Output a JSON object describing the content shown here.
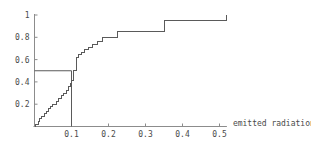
{
  "chart_data": {
    "type": "line",
    "subtype": "step-cdf",
    "title": "",
    "subtitle": "",
    "xlabel": "emitted radiation",
    "ylabel": "",
    "xlim": [
      0.0,
      0.52
    ],
    "ylim": [
      0.0,
      1.0
    ],
    "grid": false,
    "legend": null,
    "xticks": [
      0.1,
      0.2,
      0.3,
      0.4,
      0.5
    ],
    "xtick_labels": [
      "0.1",
      "0.2",
      "0.3",
      "0.4",
      "0.5"
    ],
    "yticks": [
      0.2,
      0.4,
      0.6,
      0.8,
      1.0
    ],
    "ytick_labels": [
      "0.2",
      "0.4",
      "0.6",
      "0.8",
      "1"
    ],
    "line_color": "#5a5a5a",
    "axis_color": "#8c8c8c",
    "series": [
      {
        "name": "empirical CDF",
        "step": "post",
        "x": [
          0.0,
          0.004,
          0.01,
          0.013,
          0.02,
          0.026,
          0.032,
          0.038,
          0.043,
          0.049,
          0.055,
          0.06,
          0.066,
          0.073,
          0.079,
          0.087,
          0.092,
          0.098,
          0.1,
          0.106,
          0.113,
          0.12,
          0.128,
          0.136,
          0.147,
          0.158,
          0.17,
          0.185,
          0.2,
          0.225,
          0.255,
          0.3,
          0.35,
          0.4,
          0.52
        ],
        "y": [
          0.0,
          0.02,
          0.045,
          0.07,
          0.09,
          0.115,
          0.135,
          0.16,
          0.18,
          0.2,
          0.2,
          0.225,
          0.25,
          0.275,
          0.3,
          0.325,
          0.355,
          0.385,
          0.41,
          0.5,
          0.62,
          0.645,
          0.665,
          0.69,
          0.71,
          0.735,
          0.76,
          0.795,
          0.8,
          0.855,
          0.855,
          0.855,
          0.95,
          0.95,
          1.0
        ]
      }
    ],
    "annotations": [
      {
        "name": "median-guide-horizontal",
        "type": "hline-segment",
        "y": 0.5,
        "x_from": 0.0,
        "x_to": 0.1,
        "label": ""
      },
      {
        "name": "median-guide-vertical",
        "type": "vline-segment",
        "x": 0.1,
        "y_from": 0.0,
        "y_to": 0.5,
        "label": ""
      }
    ]
  },
  "axes": {
    "x_axis_label": "emitted radiation",
    "y_axis_label": ""
  }
}
